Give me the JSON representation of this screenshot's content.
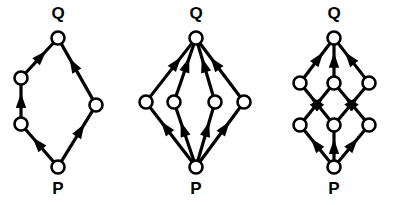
{
  "figure": {
    "name": "poset-hasse-diagrams",
    "background_color": "#ffffff",
    "stroke_color": "#000000",
    "node_fill_color": "#ffffff",
    "width": 397,
    "height": 205,
    "label_top": "Q",
    "label_bottom": "P",
    "node_radius": 6.5,
    "edge_width": 3.2,
    "node_stroke_width": 2.6,
    "arrow_length": 15,
    "arrow_half_width": 5.2
  },
  "diagrams": [
    {
      "id": "diagram-1",
      "name": "chain-pair-diamond",
      "top_label": "Q",
      "bottom_label": "P",
      "top_label_pos": {
        "x": 58,
        "y": 15
      },
      "bottom_label_pos": {
        "x": 58,
        "y": 190
      },
      "nodes": [
        {
          "id": "Q",
          "name": "node-q",
          "x": 58,
          "y": 38
        },
        {
          "id": "P",
          "name": "node-p",
          "x": 58,
          "y": 167
        },
        {
          "id": "L1",
          "name": "node-left-upper",
          "x": 21,
          "y": 78
        },
        {
          "id": "L2",
          "name": "node-left-lower",
          "x": 21,
          "y": 124
        },
        {
          "id": "R1",
          "name": "node-right-mid",
          "x": 96,
          "y": 105
        }
      ],
      "edges": [
        {
          "from": "P",
          "to": "L2",
          "name": "edge-p-to-left-lower"
        },
        {
          "from": "L2",
          "to": "L1",
          "name": "edge-left-lower-to-left-upper"
        },
        {
          "from": "L1",
          "to": "Q",
          "name": "edge-left-upper-to-q"
        },
        {
          "from": "P",
          "to": "R1",
          "name": "edge-p-to-right-mid"
        },
        {
          "from": "R1",
          "to": "Q",
          "name": "edge-right-mid-to-q"
        }
      ]
    },
    {
      "id": "diagram-2",
      "name": "four-parallel-antichain",
      "top_label": "Q",
      "bottom_label": "P",
      "top_label_pos": {
        "x": 196,
        "y": 15
      },
      "bottom_label_pos": {
        "x": 196,
        "y": 190
      },
      "nodes": [
        {
          "id": "Q",
          "name": "node-q",
          "x": 196,
          "y": 38
        },
        {
          "id": "P",
          "name": "node-p",
          "x": 196,
          "y": 167
        },
        {
          "id": "A1",
          "name": "node-mid-1",
          "x": 146,
          "y": 102
        },
        {
          "id": "A2",
          "name": "node-mid-2",
          "x": 174,
          "y": 102
        },
        {
          "id": "A3",
          "name": "node-mid-3",
          "x": 215,
          "y": 102
        },
        {
          "id": "A4",
          "name": "node-mid-4",
          "x": 244,
          "y": 102
        }
      ],
      "edges": [
        {
          "from": "P",
          "to": "A1",
          "name": "edge-p-to-mid-1"
        },
        {
          "from": "P",
          "to": "A2",
          "name": "edge-p-to-mid-2"
        },
        {
          "from": "P",
          "to": "A3",
          "name": "edge-p-to-mid-3"
        },
        {
          "from": "P",
          "to": "A4",
          "name": "edge-p-to-mid-4"
        },
        {
          "from": "A1",
          "to": "Q",
          "name": "edge-mid-1-to-q"
        },
        {
          "from": "A2",
          "to": "Q",
          "name": "edge-mid-2-to-q"
        },
        {
          "from": "A3",
          "to": "Q",
          "name": "edge-mid-3-to-q"
        },
        {
          "from": "A4",
          "to": "Q",
          "name": "edge-mid-4-to-q"
        }
      ]
    },
    {
      "id": "diagram-3",
      "name": "two-layer-lattice",
      "top_label": "Q",
      "bottom_label": "P",
      "top_label_pos": {
        "x": 334,
        "y": 15
      },
      "bottom_label_pos": {
        "x": 334,
        "y": 190
      },
      "nodes": [
        {
          "id": "Q",
          "name": "node-q",
          "x": 334,
          "y": 38
        },
        {
          "id": "P",
          "name": "node-p",
          "x": 334,
          "y": 167
        },
        {
          "id": "U1",
          "name": "node-upper-left",
          "x": 300,
          "y": 83
        },
        {
          "id": "U2",
          "name": "node-upper-center",
          "x": 334,
          "y": 83
        },
        {
          "id": "U3",
          "name": "node-upper-right",
          "x": 369,
          "y": 83
        },
        {
          "id": "D1",
          "name": "node-lower-left",
          "x": 300,
          "y": 125
        },
        {
          "id": "D2",
          "name": "node-lower-center",
          "x": 334,
          "y": 125
        },
        {
          "id": "D3",
          "name": "node-lower-right",
          "x": 369,
          "y": 125
        }
      ],
      "edges": [
        {
          "from": "P",
          "to": "D1",
          "name": "edge-p-to-lower-left"
        },
        {
          "from": "P",
          "to": "D2",
          "name": "edge-p-to-lower-center"
        },
        {
          "from": "P",
          "to": "D3",
          "name": "edge-p-to-lower-right"
        },
        {
          "from": "D1",
          "to": "U2",
          "name": "edge-lower-left-to-upper-center"
        },
        {
          "from": "D2",
          "to": "U1",
          "name": "edge-lower-center-to-upper-left"
        },
        {
          "from": "D2",
          "to": "U3",
          "name": "edge-lower-center-to-upper-right"
        },
        {
          "from": "D3",
          "to": "U2",
          "name": "edge-lower-right-to-upper-center"
        },
        {
          "from": "U1",
          "to": "Q",
          "name": "edge-upper-left-to-q"
        },
        {
          "from": "U2",
          "to": "Q",
          "name": "edge-upper-center-to-q"
        },
        {
          "from": "U3",
          "to": "Q",
          "name": "edge-upper-right-to-q"
        }
      ]
    }
  ]
}
